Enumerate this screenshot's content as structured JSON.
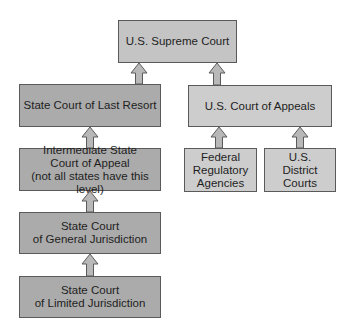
{
  "diagram": {
    "title": "",
    "colors": {
      "state_box": "#ababab",
      "federal_box": "#cdcdcd",
      "supreme_box": "#c4c4c4",
      "border": "#5a5a5a",
      "arrow": "#b5b5b5"
    },
    "nodes": {
      "supreme": {
        "label": "U.S. Supreme Court"
      },
      "state_last_resort": {
        "label": "State Court of Last Resort"
      },
      "us_appeals": {
        "label": "U.S. Court of Appeals"
      },
      "state_intermediate": {
        "label": "Intermediate State\nCourt of Appeal\n(not all states have this level)"
      },
      "federal_agencies": {
        "label": "Federal\nRegulatory\nAgencies"
      },
      "district_courts": {
        "label": "U.S.\nDistrict\nCourts"
      },
      "state_general": {
        "label": "State Court\nof General Jurisdiction"
      },
      "state_limited": {
        "label": "State Court\nof Limited Jurisdiction"
      }
    },
    "edges": [
      {
        "from": "state_last_resort",
        "to": "supreme"
      },
      {
        "from": "us_appeals",
        "to": "supreme"
      },
      {
        "from": "state_intermediate",
        "to": "state_last_resort"
      },
      {
        "from": "federal_agencies",
        "to": "us_appeals"
      },
      {
        "from": "district_courts",
        "to": "us_appeals"
      },
      {
        "from": "state_general",
        "to": "state_intermediate"
      },
      {
        "from": "state_limited",
        "to": "state_general"
      }
    ]
  }
}
